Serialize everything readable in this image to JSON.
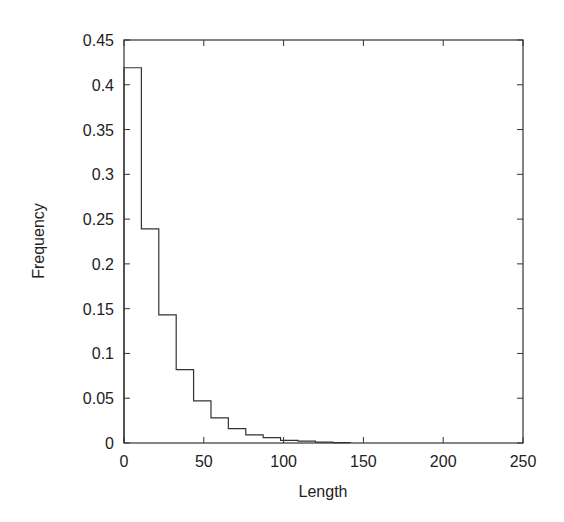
{
  "chart_data": {
    "type": "bar",
    "style": "step-histogram",
    "title": "",
    "xlabel": "Length",
    "ylabel": "Frequency",
    "xlim": [
      0,
      250
    ],
    "ylim": [
      0,
      0.45
    ],
    "grid": false,
    "legend": null,
    "xticks": [
      0,
      50,
      100,
      150,
      200,
      250
    ],
    "xtick_labels": [
      "0",
      "50",
      "100",
      "150",
      "200",
      "250"
    ],
    "yticks": [
      0,
      0.05,
      0.1,
      0.15,
      0.2,
      0.25,
      0.3,
      0.35,
      0.4,
      0.45
    ],
    "ytick_labels": [
      "0",
      "0.05",
      "0.1",
      "0.15",
      "0.2",
      "0.25",
      "0.3",
      "0.35",
      "0.4",
      "0.45"
    ],
    "bin_width": 10.9,
    "bin_edges": [
      0,
      10.9,
      21.8,
      32.7,
      43.6,
      54.5,
      65.4,
      76.3,
      87.2,
      98.1,
      109.0,
      119.9,
      130.8,
      141.7
    ],
    "values": [
      0.419,
      0.239,
      0.143,
      0.082,
      0.047,
      0.028,
      0.016,
      0.009,
      0.006,
      0.003,
      0.002,
      0.001,
      0.0005
    ],
    "colors": {
      "line": "#333333",
      "axis": "#333333",
      "text": "#222222"
    }
  }
}
